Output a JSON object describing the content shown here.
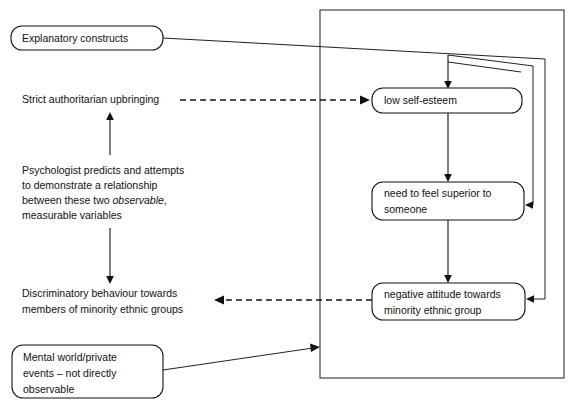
{
  "diagram": {
    "colors": {
      "stroke": "#111111",
      "container_stroke": "#444444",
      "background": "#ffffff"
    },
    "labels": {
      "explanatory_constructs": "Explanatory constructs",
      "strict_upbringing": "Strict authoritarian upbringing",
      "psychologist_line1": "Psychologist predicts and attempts",
      "psychologist_line2": "to demonstrate a relationship",
      "psychologist_line3a": "between these two ",
      "psychologist_line3_italic": "observable",
      "psychologist_line3b": ",",
      "psychologist_line4": "measurable variables",
      "discriminatory_line1": "Discriminatory behaviour towards",
      "discriminatory_line2": "members of minority ethnic groups",
      "mental_world_line1": "Mental world/private",
      "mental_world_line2": "events – not directly",
      "mental_world_line3": "observable",
      "low_self_esteem": "low self-esteem",
      "need_superior_line1": "need to feel superior to",
      "need_superior_line2": "someone",
      "negative_attitude_line1": "negative attitude towards",
      "negative_attitude_line2": "minority ethnic group"
    }
  }
}
